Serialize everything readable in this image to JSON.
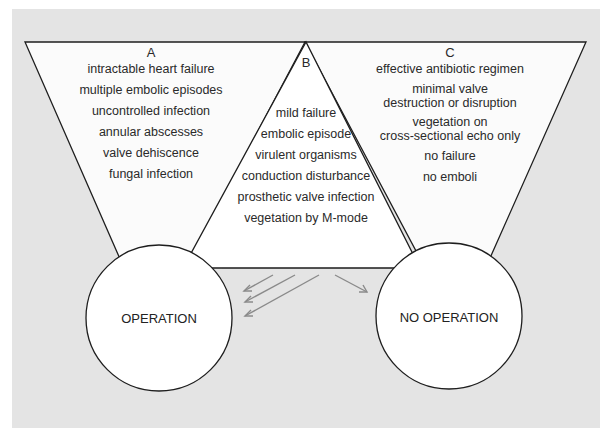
{
  "diagram": {
    "type": "decision diagram",
    "panels": {
      "A": {
        "heading": "A",
        "items": [
          "intractable heart failure",
          "multiple embolic episodes",
          "uncontrolled infection",
          "annular abscesses",
          "valve dehiscence",
          "fungal infection"
        ]
      },
      "B": {
        "heading": "B",
        "items": [
          "mild failure",
          "embolic episode",
          "virulent organisms",
          "conduction disturbance",
          "prosthetic valve infection",
          "vegetation by M-mode"
        ]
      },
      "C": {
        "heading": "C",
        "items": [
          "effective antibiotic regimen",
          "minimal valve\ndestruction or disruption",
          "vegetation on\ncross-sectional echo only",
          "no failure",
          "no emboli"
        ]
      }
    },
    "outcomes": {
      "left": "OPERATION",
      "right": "NO OPERATION"
    },
    "arrows": {
      "to_operation_count": 3,
      "to_no_operation_count": 1
    },
    "colors": {
      "background_panel": "#e4e4e4",
      "shape_fill": "#ffffff",
      "outline": "#1e1e1e",
      "arrow": "#8a8a8a"
    }
  }
}
